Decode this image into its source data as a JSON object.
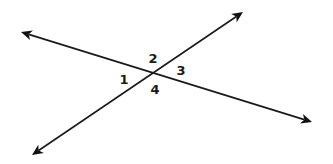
{
  "diagram": {
    "type": "intersecting-lines",
    "colors": {
      "line": "#1a1a1a",
      "background": "#ffffff"
    },
    "intersection": {
      "x": 151,
      "y": 72
    },
    "lines": [
      {
        "id": "line-a",
        "from": {
          "x": 21,
          "y": 32
        },
        "to": {
          "x": 312,
          "y": 122
        },
        "arrows": [
          "start",
          "end"
        ]
      },
      {
        "id": "line-b",
        "from": {
          "x": 32,
          "y": 155
        },
        "to": {
          "x": 243,
          "y": 12
        },
        "arrows": [
          "start",
          "end"
        ]
      }
    ],
    "angles": [
      {
        "label": "1",
        "x": 124,
        "y": 84
      },
      {
        "label": "2",
        "x": 153,
        "y": 63
      },
      {
        "label": "3",
        "x": 181,
        "y": 75
      },
      {
        "label": "4",
        "x": 155,
        "y": 94
      }
    ]
  }
}
